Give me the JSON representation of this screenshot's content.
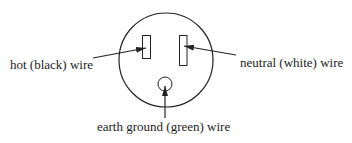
{
  "diagram": {
    "labels": {
      "hot": "hot (black) wire",
      "neutral": "neutral (white) wire",
      "ground": "earth ground (green) wire"
    },
    "parts": [
      "outlet-face",
      "hot-slot",
      "neutral-slot",
      "ground-hole"
    ]
  }
}
